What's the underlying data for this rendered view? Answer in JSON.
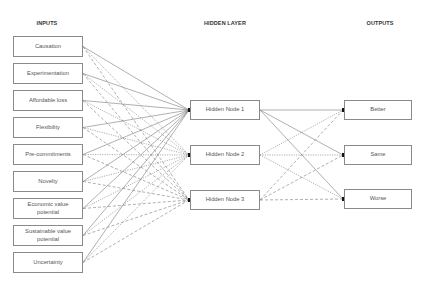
{
  "headers": {
    "inputs": "INPUTS",
    "hidden": "HIDDEN LAYER",
    "outputs": "OUTPUTS"
  },
  "inputs": [
    "Causation",
    "Experimentation",
    "Affordable loss",
    "Flexibility",
    "Pre-commitments",
    "Novelty",
    "Economic value potential",
    "Sustainable value potential",
    "Uncertainty"
  ],
  "hidden": [
    "Hidden Node 1",
    "Hidden Node 2",
    "Hidden Node 3"
  ],
  "outputs": [
    "Better",
    "Same",
    "Worse"
  ],
  "link_styles": {
    "hidden_node_1": "solid",
    "hidden_node_2": "dotted",
    "hidden_node_3": "dashed"
  },
  "colors": {
    "line": "#7a7a7a",
    "box_border": "#8a8a8a",
    "text": "#555555"
  }
}
